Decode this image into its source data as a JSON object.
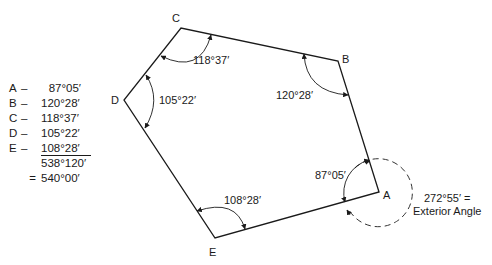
{
  "figure": {
    "type": "polygon-interior-angles",
    "vertices": [
      {
        "id": "A",
        "label": "A",
        "interior_angle": "87°05′"
      },
      {
        "id": "B",
        "label": "B",
        "interior_angle": "120°28′"
      },
      {
        "id": "C",
        "label": "C",
        "interior_angle": "118°37′"
      },
      {
        "id": "D",
        "label": "D",
        "interior_angle": "105°22′"
      },
      {
        "id": "E",
        "label": "E",
        "interior_angle": "108°28′"
      }
    ],
    "exterior": {
      "value": "272°55′ =",
      "caption": "Exterior Angle"
    }
  },
  "summary": {
    "rows": [
      {
        "letter": "A",
        "dash": "–",
        "value": "87°05′"
      },
      {
        "letter": "B",
        "dash": "–",
        "value": "120°28′"
      },
      {
        "letter": "C",
        "dash": "–",
        "value": "118°37′"
      },
      {
        "letter": "D",
        "dash": "–",
        "value": "105°22′"
      },
      {
        "letter": "E",
        "dash": "–",
        "value": "108°28′"
      }
    ],
    "subtotal": "538°120′",
    "equals": "=",
    "total": "540°00′"
  },
  "colors": {
    "line": "#1a1a1a",
    "background": "#ffffff"
  }
}
